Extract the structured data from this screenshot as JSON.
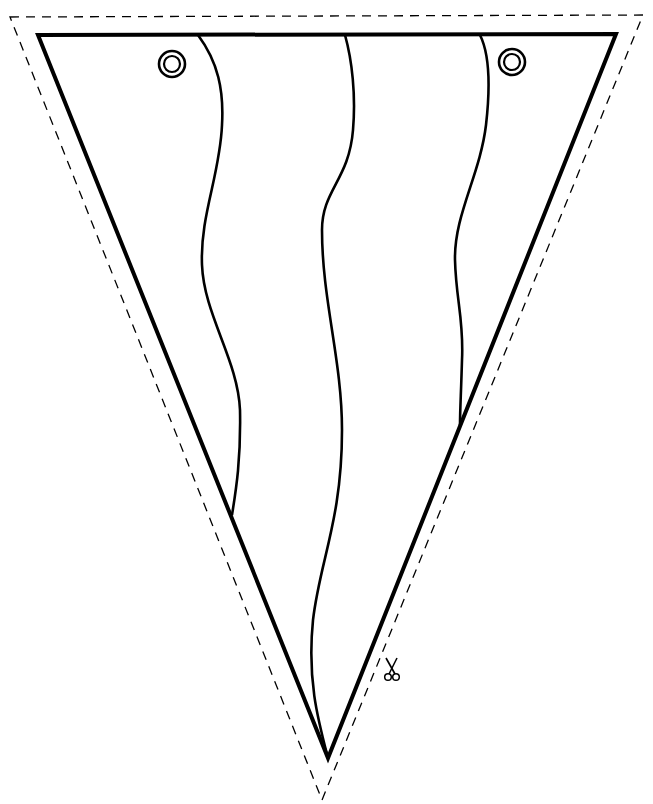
{
  "colors": {
    "background": "#ffffff",
    "ink": "#000000"
  },
  "pennant": {
    "shape": "inverted-triangle",
    "stripe_count": 4,
    "grommet_count": 2
  },
  "cut_line": {
    "style": "dashed",
    "icon": "scissors-icon"
  }
}
